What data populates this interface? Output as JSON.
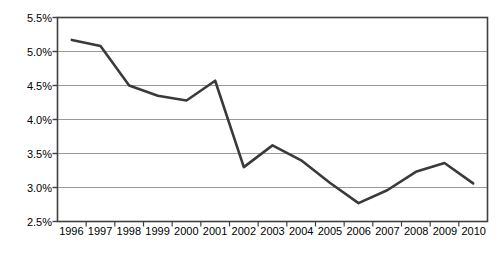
{
  "chart_data": {
    "type": "line",
    "title": "",
    "subtitle": "",
    "xlabel": "",
    "ylabel": "",
    "categories": [
      "1996",
      "1997",
      "1998",
      "1999",
      "2000",
      "2001",
      "2002",
      "2003",
      "2004",
      "2005",
      "2006",
      "2007",
      "2008",
      "2009",
      "2010"
    ],
    "series": [
      {
        "name": "",
        "values": [
          5.17,
          5.08,
          4.5,
          4.35,
          4.28,
          4.57,
          3.3,
          3.62,
          3.4,
          3.07,
          2.77,
          2.96,
          3.23,
          3.36,
          3.06
        ]
      }
    ],
    "ylim": [
      2.5,
      5.5
    ],
    "ytick_step": 0.5,
    "ytick_labels": [
      "5.5%",
      "5.0%",
      "4.5%",
      "4.0%",
      "3.5%",
      "3.0%",
      "2.5%"
    ],
    "ytick_values": [
      5.5,
      5.0,
      4.5,
      4.0,
      3.5,
      3.0,
      2.5
    ],
    "value_suffix": "%",
    "grid": true,
    "grid_axis": "y",
    "legend": false,
    "legend_position": "none",
    "markers": false
  },
  "style": {
    "line_color": "#3a3a3a",
    "grid_color": "#9a9a9a",
    "axis_color": "#404040",
    "background": "#ffffff",
    "text_color": "#000000"
  }
}
